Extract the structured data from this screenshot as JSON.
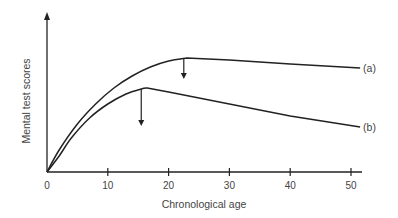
{
  "chart_data": {
    "type": "line",
    "title": "",
    "xlabel": "Chronological age",
    "ylabel": "Mental test scores",
    "xlim": [
      0,
      52
    ],
    "ylim": [
      0,
      130
    ],
    "x_ticks": [
      0,
      10,
      20,
      30,
      40,
      50
    ],
    "y_ticks": [],
    "grid": false,
    "legend": "inline labels at right end of curves",
    "series": [
      {
        "name": "(a)",
        "points": [
          [
            0,
            0
          ],
          [
            2,
            22
          ],
          [
            5,
            48
          ],
          [
            8,
            68
          ],
          [
            11,
            84
          ],
          [
            14,
            96
          ],
          [
            17,
            105
          ],
          [
            20,
            111
          ],
          [
            23,
            114
          ],
          [
            30,
            112
          ],
          [
            40,
            108
          ],
          [
            51.5,
            104
          ]
        ],
        "peak_age": 23,
        "arrow_at_age": 22.5
      },
      {
        "name": "(b)",
        "points": [
          [
            0,
            0
          ],
          [
            2,
            16
          ],
          [
            4,
            34
          ],
          [
            7,
            54
          ],
          [
            10,
            68
          ],
          [
            13,
            78
          ],
          [
            15.5,
            83
          ],
          [
            16.5,
            84
          ],
          [
            20,
            80
          ],
          [
            30,
            68
          ],
          [
            40,
            56
          ],
          [
            51.5,
            45
          ]
        ],
        "peak_age": 16.5,
        "arrow_at_age": 15.5
      }
    ],
    "annotations": [
      {
        "type": "down-arrow",
        "series": "(a)",
        "age": 22.5
      },
      {
        "type": "down-arrow",
        "series": "(b)",
        "age": 15.5
      }
    ]
  },
  "colors": {
    "line": "#222222",
    "text": "#444444",
    "background": "#ffffff"
  }
}
